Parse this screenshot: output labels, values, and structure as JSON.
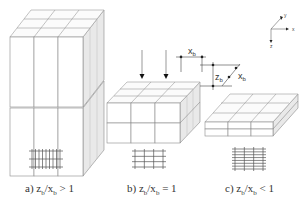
{
  "figure": {
    "panels": [
      {
        "id": "a",
        "caption_prefix": "a)",
        "caption_z": "z",
        "caption_sub1": "b",
        "caption_slash": "/x",
        "caption_sub2": "b",
        "caption_relation": " > 1",
        "description": "tall blocks, z_b/x_b > 1",
        "block_grid": {
          "cols": 3,
          "rows_depth": 3,
          "layers": 2
        },
        "cross_section": {
          "vertical_lines": 9,
          "horizontal_lines": 3
        }
      },
      {
        "id": "b",
        "caption_prefix": "b)",
        "caption_z": "z",
        "caption_sub1": "b",
        "caption_slash": "/x",
        "caption_sub2": "b",
        "caption_relation": " = 1",
        "description": "cubic blocks, z_b/x_b = 1",
        "block_grid": {
          "cols": 3,
          "rows_depth": 3,
          "layers": 2
        },
        "cross_section": {
          "vertical_lines": 4,
          "horizontal_lines": 4
        }
      },
      {
        "id": "c",
        "caption_prefix": "c)",
        "caption_z": "z",
        "caption_sub1": "b",
        "caption_slash": "/x",
        "caption_sub2": "b",
        "caption_relation": " < 1",
        "description": "flat blocks, z_b/x_b < 1",
        "block_grid": {
          "cols": 3,
          "rows_depth": 3,
          "layers": 2
        },
        "cross_section": {
          "vertical_lines": 4,
          "horizontal_lines": 8
        }
      }
    ],
    "dimensions": {
      "x_label": "x",
      "x_sub": "b",
      "z_label": "z",
      "z_sub": "b",
      "depth_label": "x",
      "depth_sub": "b"
    },
    "axes": {
      "x": "x",
      "y": "y",
      "z": "z"
    },
    "load_arrows": 2
  }
}
